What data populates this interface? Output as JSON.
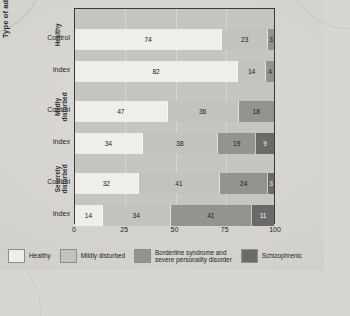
{
  "axes": {
    "y_title": "Type of adoptive family",
    "x_ticks": [
      "0",
      "25",
      "50",
      "75",
      "100"
    ],
    "x_tick_values": [
      0,
      25,
      50,
      75,
      100
    ]
  },
  "groups": [
    {
      "label": "Healthy",
      "rows": [
        "Control",
        "Index"
      ]
    },
    {
      "label": "Mildly\ndisturbed",
      "rows": [
        "Control",
        "Index"
      ]
    },
    {
      "label": "Severely\ndisturbed",
      "rows": [
        "Control",
        "Index"
      ]
    }
  ],
  "legend": [
    {
      "label": "Healthy",
      "color": "#efeee9"
    },
    {
      "label": "Mildly disturbed",
      "color": "#c3c2bd"
    },
    {
      "label": "Borderline syndrome and\nsevere personality disorder",
      "color": "#939390"
    },
    {
      "label": "Schizophrenic",
      "color": "#6a6a68"
    }
  ],
  "chart_data": {
    "type": "bar",
    "orientation": "horizontal",
    "stacked": true,
    "normalized_percent": true,
    "title": "",
    "xlabel": "",
    "ylabel": "Type of adoptive family",
    "xlim": [
      0,
      100
    ],
    "grid": true,
    "legend_position": "bottom",
    "categories": [
      "Healthy / Control",
      "Healthy / Index",
      "Mildly disturbed / Control",
      "Mildly disturbed / Index",
      "Severely disturbed / Control",
      "Severely disturbed / Index"
    ],
    "series": [
      {
        "name": "Healthy",
        "color": "#efeee9",
        "values": [
          74,
          82,
          47,
          34,
          32,
          14
        ]
      },
      {
        "name": "Mildly disturbed",
        "color": "#c3c2bd",
        "values": [
          23,
          14,
          36,
          38,
          41,
          34
        ]
      },
      {
        "name": "Borderline syndrome and severe personality disorder",
        "color": "#939390",
        "values": [
          3,
          4,
          18,
          19,
          24,
          41
        ]
      },
      {
        "name": "Schizophrenic",
        "color": "#6a6a68",
        "values": [
          0,
          0,
          0,
          9,
          3,
          11
        ]
      }
    ],
    "bars": [
      {
        "group": "Healthy",
        "row": "Control",
        "segments": [
          {
            "series": "Healthy",
            "value": 74,
            "label": "74"
          },
          {
            "series": "Mildly disturbed",
            "value": 23,
            "label": "23"
          },
          {
            "series": "Borderline syndrome and severe personality disorder",
            "value": 3,
            "label": "3"
          }
        ]
      },
      {
        "group": "Healthy",
        "row": "Index",
        "segments": [
          {
            "series": "Healthy",
            "value": 82,
            "label": "82"
          },
          {
            "series": "Mildly disturbed",
            "value": 14,
            "label": "14"
          },
          {
            "series": "Borderline syndrome and severe personality disorder",
            "value": 4,
            "label": "4"
          }
        ]
      },
      {
        "group": "Mildly disturbed",
        "row": "Control",
        "segments": [
          {
            "series": "Healthy",
            "value": 47,
            "label": "47"
          },
          {
            "series": "Mildly disturbed",
            "value": 36,
            "label": "36"
          },
          {
            "series": "Borderline syndrome and severe personality disorder",
            "value": 18,
            "label": "18"
          }
        ]
      },
      {
        "group": "Mildly disturbed",
        "row": "Index",
        "segments": [
          {
            "series": "Healthy",
            "value": 34,
            "label": "34"
          },
          {
            "series": "Mildly disturbed",
            "value": 38,
            "label": "38"
          },
          {
            "series": "Borderline syndrome and severe personality disorder",
            "value": 19,
            "label": "19"
          },
          {
            "series": "Schizophrenic",
            "value": 9,
            "label": "9"
          }
        ]
      },
      {
        "group": "Severely disturbed",
        "row": "Control",
        "segments": [
          {
            "series": "Healthy",
            "value": 32,
            "label": "32"
          },
          {
            "series": "Mildly disturbed",
            "value": 41,
            "label": "41"
          },
          {
            "series": "Borderline syndrome and severe personality disorder",
            "value": 24,
            "label": "24"
          },
          {
            "series": "Schizophrenic",
            "value": 3,
            "label": "3"
          }
        ]
      },
      {
        "group": "Severely disturbed",
        "row": "Index",
        "segments": [
          {
            "series": "Healthy",
            "value": 14,
            "label": "14"
          },
          {
            "series": "Mildly disturbed",
            "value": 34,
            "label": "34"
          },
          {
            "series": "Borderline syndrome and severe personality disorder",
            "value": 41,
            "label": "41"
          },
          {
            "series": "Schizophrenic",
            "value": 11,
            "label": "11"
          }
        ]
      }
    ]
  }
}
